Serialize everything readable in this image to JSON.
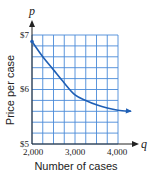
{
  "chart_data": {
    "type": "line",
    "title": "",
    "xlabel": "Number of cases",
    "ylabel": "Price per case",
    "x_variable": "q",
    "y_variable": "p",
    "x_ticks": [
      "2,000",
      "3,000",
      "4,000"
    ],
    "y_ticks": [
      "$5",
      "$6",
      "$7"
    ],
    "xlim": [
      2000,
      4000
    ],
    "ylim": [
      5,
      7
    ],
    "grid": true,
    "grid_x_step": 250,
    "grid_y_step": 0.2,
    "series": [
      {
        "name": "price curve",
        "x": [
          2000,
          2250,
          2500,
          2750,
          3000,
          3250,
          3500,
          3750,
          4000,
          4300
        ],
        "values": [
          6.88,
          6.6,
          6.36,
          6.12,
          5.9,
          5.8,
          5.72,
          5.66,
          5.62,
          5.6
        ]
      }
    ],
    "colors": {
      "grid": "#4a8ad8",
      "curve": "#1f5fb5",
      "axis": "#222222"
    }
  }
}
